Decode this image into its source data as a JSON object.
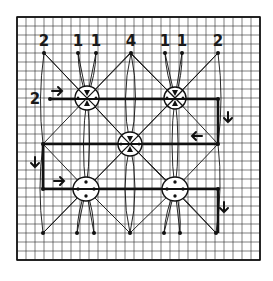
{
  "diagram": {
    "type": "hand-drawn grid diagram",
    "grid": {
      "x0": 17,
      "y0": 17,
      "x1": 260,
      "y1": 260,
      "cell": 9,
      "color": "#2a2a2a",
      "major_color": "#111111"
    },
    "top_labels": [
      {
        "text": "2",
        "x": 44,
        "y": 46
      },
      {
        "text": "1",
        "x": 78,
        "y": 46
      },
      {
        "text": "1",
        "x": 96,
        "y": 46
      },
      {
        "text": "4",
        "x": 131,
        "y": 46
      },
      {
        "text": "1",
        "x": 165,
        "y": 46
      },
      {
        "text": "1",
        "x": 182,
        "y": 46
      },
      {
        "text": "2",
        "x": 218,
        "y": 46
      }
    ],
    "side_label": {
      "text": "2",
      "x": 35,
      "y": 104
    },
    "top_dots": [
      [
        44,
        53
      ],
      [
        78,
        53
      ],
      [
        96,
        53
      ],
      [
        131,
        53
      ],
      [
        165,
        53
      ],
      [
        182,
        53
      ],
      [
        218,
        53
      ]
    ],
    "bottom_dots": [
      [
        43,
        233
      ],
      [
        77,
        233
      ],
      [
        94,
        233
      ],
      [
        130,
        233
      ],
      [
        164,
        233
      ],
      [
        180,
        233
      ],
      [
        216,
        233
      ]
    ],
    "crossed_circles": [
      {
        "name": "upper-left",
        "cx": 87,
        "cy": 98,
        "r": 12
      },
      {
        "name": "upper-right",
        "cx": 175,
        "cy": 98,
        "r": 11
      },
      {
        "name": "center",
        "cx": 130,
        "cy": 144,
        "r": 12
      }
    ],
    "dotted_circles": [
      {
        "name": "lower-left",
        "cx": 86,
        "cy": 189,
        "r": 12
      },
      {
        "name": "lower-right",
        "cx": 175,
        "cy": 189,
        "r": 12
      }
    ],
    "arrows": [
      {
        "direction": "right",
        "x": 58,
        "y": 91
      },
      {
        "direction": "down",
        "x": 228,
        "y": 118
      },
      {
        "direction": "left",
        "x": 196,
        "y": 136
      },
      {
        "direction": "down",
        "x": 35,
        "y": 163
      },
      {
        "direction": "right",
        "x": 60,
        "y": 181
      },
      {
        "direction": "down",
        "x": 224,
        "y": 208
      }
    ],
    "path": "serpentine route: row y=99 left→right, down at x=218, row y=144 right→left, down at x=43, row y=189 left→right, down at x=218"
  }
}
